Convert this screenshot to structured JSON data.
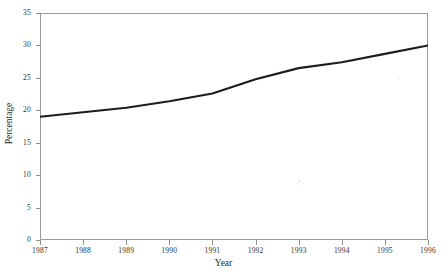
{
  "chart_data": {
    "type": "line",
    "title": "",
    "xlabel": "Year",
    "ylabel": "Percentage",
    "x": [
      1987,
      1988,
      1989,
      1990,
      1991,
      1992,
      1993,
      1994,
      1995,
      1996
    ],
    "values": [
      19.0,
      19.7,
      20.4,
      21.4,
      22.6,
      24.8,
      26.5,
      27.4,
      28.7,
      30.0
    ],
    "series": [
      {
        "name": "Percentage",
        "values": [
          19.0,
          19.7,
          20.4,
          21.4,
          22.6,
          24.8,
          26.5,
          27.4,
          28.7,
          30.0
        ]
      }
    ],
    "xlim": [
      1987,
      1996
    ],
    "ylim": [
      0,
      35
    ],
    "ytick_labels": [
      "0",
      "5",
      "10",
      "15",
      "20",
      "25",
      "30",
      "35"
    ],
    "ytick_values": [
      0,
      5,
      10,
      15,
      20,
      25,
      30,
      35
    ],
    "xtick_labels": [
      "1987",
      "1988",
      "1989",
      "1990",
      "1991",
      "1992",
      "1993",
      "1994",
      "1995",
      "1996"
    ],
    "grid": false,
    "legend": false,
    "line_color": "#1c1c1c",
    "axis_color": "#9a9a9a",
    "background_color": "#ffffff"
  }
}
